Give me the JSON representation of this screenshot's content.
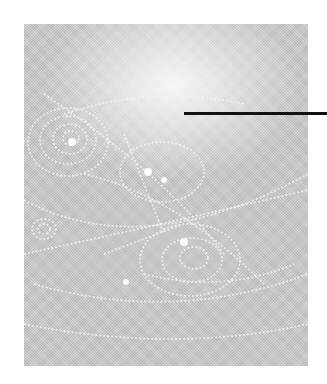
{
  "figure": {
    "style": "grayscale halftone",
    "colors": {
      "background": "#ffffff",
      "photo_base": "#cfcfcf",
      "tracks": "#f4f4f4",
      "pointer_line": "#111111"
    }
  },
  "annotation": {
    "pointer_line": {
      "x1": 184,
      "x2": 327,
      "y": 113,
      "label": ""
    }
  }
}
